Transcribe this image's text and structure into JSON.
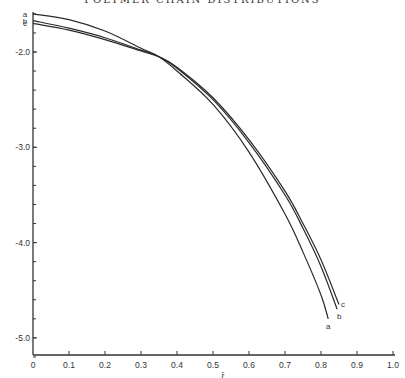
{
  "title": "POLYMER CHAIN DISTRIBUTIONS",
  "chart_data": {
    "type": "line",
    "title": "POLYMER CHAIN DISTRIBUTIONS",
    "xlabel": "r̄",
    "ylabel": "",
    "xlim": [
      0,
      1.0
    ],
    "ylim": [
      -5.2,
      -1.55
    ],
    "grid": false,
    "legend": "curve end labels a, b, c",
    "x_ticks": [
      "0",
      "0.1",
      "0.2",
      "0.3",
      "0.4",
      "0.5",
      "0.6",
      "0.7",
      "0.8",
      "0.9",
      "1.0"
    ],
    "y_ticks": [
      "-2.0",
      "-3.0",
      "-4.0",
      "-5.0"
    ],
    "series": [
      {
        "name": "a",
        "x": [
          0,
          0.1,
          0.2,
          0.3,
          0.35,
          0.4,
          0.5,
          0.6,
          0.7,
          0.75,
          0.8,
          0.82
        ],
        "values": [
          -1.6,
          -1.66,
          -1.78,
          -1.96,
          -2.05,
          -2.2,
          -2.55,
          -3.05,
          -3.7,
          -4.1,
          -4.55,
          -4.8
        ]
      },
      {
        "name": "b",
        "x": [
          0,
          0.1,
          0.2,
          0.3,
          0.35,
          0.4,
          0.5,
          0.6,
          0.7,
          0.75,
          0.8,
          0.845
        ],
        "values": [
          -1.67,
          -1.75,
          -1.85,
          -1.98,
          -2.05,
          -2.17,
          -2.5,
          -2.95,
          -3.5,
          -3.85,
          -4.25,
          -4.7
        ]
      },
      {
        "name": "c",
        "x": [
          0,
          0.1,
          0.2,
          0.3,
          0.35,
          0.4,
          0.5,
          0.6,
          0.7,
          0.75,
          0.8,
          0.85
        ],
        "values": [
          -1.7,
          -1.77,
          -1.87,
          -1.99,
          -2.05,
          -2.16,
          -2.48,
          -2.92,
          -3.46,
          -3.8,
          -4.18,
          -4.65
        ]
      }
    ]
  }
}
